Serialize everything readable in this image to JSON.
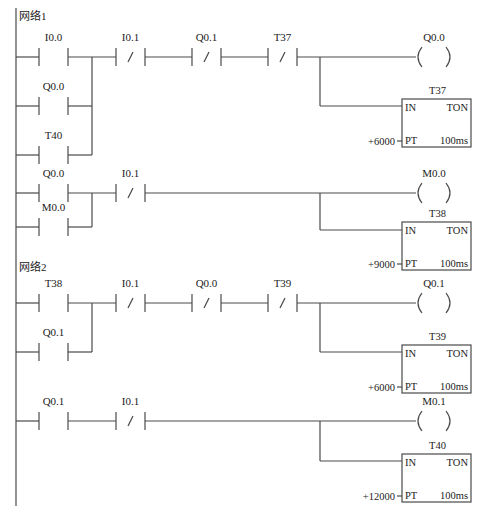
{
  "diagram": {
    "type": "ladder-logic",
    "rail": {
      "x": 16,
      "y1": 8,
      "y2": 506
    },
    "networks": [
      {
        "label": "网络1",
        "x": 19,
        "y": 20
      },
      {
        "label": "网络2",
        "x": 19,
        "y": 271
      }
    ],
    "contacts": [
      {
        "id": "c1",
        "label": "I0.0",
        "x": 39,
        "y": 57,
        "type": "NO"
      },
      {
        "id": "c2",
        "label": "Q0.0",
        "x": 39,
        "y": 106,
        "type": "NO"
      },
      {
        "id": "c3",
        "label": "T40",
        "x": 39,
        "y": 155,
        "type": "NO"
      },
      {
        "id": "c4",
        "label": "I0.1",
        "x": 116,
        "y": 57,
        "type": "NC"
      },
      {
        "id": "c5",
        "label": "Q0.1",
        "x": 192,
        "y": 57,
        "type": "NC"
      },
      {
        "id": "c6",
        "label": "T37",
        "x": 268,
        "y": 57,
        "type": "NC"
      },
      {
        "id": "c7",
        "label": "Q0.0",
        "x": 39,
        "y": 193,
        "type": "NO"
      },
      {
        "id": "c8",
        "label": "M0.0",
        "x": 39,
        "y": 227,
        "type": "NO"
      },
      {
        "id": "c9",
        "label": "I0.1",
        "x": 116,
        "y": 193,
        "type": "NC"
      },
      {
        "id": "c10",
        "label": "T38",
        "x": 39,
        "y": 303,
        "type": "NO"
      },
      {
        "id": "c11",
        "label": "Q0.1",
        "x": 39,
        "y": 352,
        "type": "NO"
      },
      {
        "id": "c12",
        "label": "I0.1",
        "x": 116,
        "y": 303,
        "type": "NC"
      },
      {
        "id": "c13",
        "label": "Q0.0",
        "x": 192,
        "y": 303,
        "type": "NC"
      },
      {
        "id": "c14",
        "label": "T39",
        "x": 268,
        "y": 303,
        "type": "NC"
      },
      {
        "id": "c15",
        "label": "Q0.1",
        "x": 39,
        "y": 421,
        "type": "NO"
      },
      {
        "id": "c16",
        "label": "I0.1",
        "x": 116,
        "y": 421,
        "type": "NC"
      }
    ],
    "coils": [
      {
        "id": "q1",
        "label": "Q0.0",
        "x": 416,
        "y": 57
      },
      {
        "id": "q2",
        "label": "M0.0",
        "x": 416,
        "y": 193
      },
      {
        "id": "q3",
        "label": "Q0.1",
        "x": 416,
        "y": 303
      },
      {
        "id": "q4",
        "label": "M0.1",
        "x": 416,
        "y": 421
      }
    ],
    "timers": [
      {
        "id": "t1",
        "name": "T37",
        "type": "TON",
        "in": "IN",
        "pt": "PT",
        "preset": "+6000",
        "base": "100ms",
        "x": 402,
        "y": 99
      },
      {
        "id": "t2",
        "name": "T38",
        "type": "TON",
        "in": "IN",
        "pt": "PT",
        "preset": "+9000",
        "base": "100ms",
        "x": 402,
        "y": 222
      },
      {
        "id": "t3",
        "name": "T39",
        "type": "TON",
        "in": "IN",
        "pt": "PT",
        "preset": "+6000",
        "base": "100ms",
        "x": 402,
        "y": 345
      },
      {
        "id": "t4",
        "name": "T40",
        "type": "TON",
        "in": "IN",
        "pt": "PT",
        "preset": "+12000",
        "base": "100ms",
        "x": 402,
        "y": 454
      }
    ],
    "wires": [
      [
        16,
        57,
        39,
        57
      ],
      [
        68,
        57,
        116,
        57
      ],
      [
        145,
        57,
        192,
        57
      ],
      [
        221,
        57,
        268,
        57
      ],
      [
        297,
        57,
        416,
        57
      ],
      [
        16,
        106,
        39,
        106
      ],
      [
        68,
        106,
        92,
        106
      ],
      [
        16,
        155,
        39,
        155
      ],
      [
        68,
        155,
        92,
        155
      ],
      [
        92,
        57,
        92,
        155
      ],
      [
        320,
        57,
        320,
        106
      ],
      [
        320,
        106,
        402,
        106
      ],
      [
        16,
        193,
        39,
        193
      ],
      [
        68,
        193,
        116,
        193
      ],
      [
        145,
        193,
        416,
        193
      ],
      [
        16,
        227,
        39,
        227
      ],
      [
        68,
        227,
        92,
        227
      ],
      [
        92,
        193,
        92,
        227
      ],
      [
        320,
        193,
        320,
        230
      ],
      [
        320,
        230,
        402,
        230
      ],
      [
        16,
        303,
        39,
        303
      ],
      [
        68,
        303,
        116,
        303
      ],
      [
        145,
        303,
        192,
        303
      ],
      [
        221,
        303,
        268,
        303
      ],
      [
        297,
        303,
        416,
        303
      ],
      [
        16,
        352,
        39,
        352
      ],
      [
        68,
        352,
        92,
        352
      ],
      [
        92,
        303,
        92,
        352
      ],
      [
        320,
        303,
        320,
        352
      ],
      [
        320,
        352,
        402,
        352
      ],
      [
        16,
        421,
        39,
        421
      ],
      [
        68,
        421,
        116,
        421
      ],
      [
        145,
        421,
        416,
        421
      ],
      [
        320,
        421,
        320,
        461
      ],
      [
        320,
        461,
        402,
        461
      ]
    ]
  }
}
